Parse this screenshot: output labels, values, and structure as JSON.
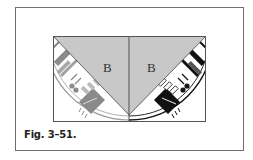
{
  "figure": {
    "caption": "Fig. 3–51.",
    "left_panel": {
      "label": "B",
      "fabric_tone": "#8a8a8a"
    },
    "right_panel": {
      "label": "B",
      "fabric_tone": "#111111"
    },
    "triangle_fill": "#c8c8c8",
    "border_color": "#6e6e6e"
  }
}
